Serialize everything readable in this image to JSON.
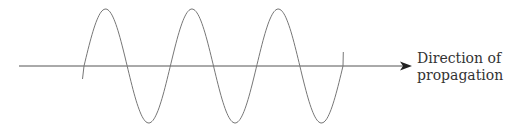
{
  "figure": {
    "type": "transverse-wave-diagram",
    "label": {
      "line1": "Direction of",
      "line2": "propagation"
    },
    "colors": {
      "axis": "#555555",
      "wave": "#777777",
      "text": "#333333",
      "background": "#ffffff"
    },
    "wave": {
      "cycles": 3,
      "start_x": 84,
      "end_x": 343,
      "axis_y": 66,
      "crest_y": 9,
      "trough_y": 123
    },
    "axis": {
      "start_x": 19,
      "end_x": 412
    }
  }
}
